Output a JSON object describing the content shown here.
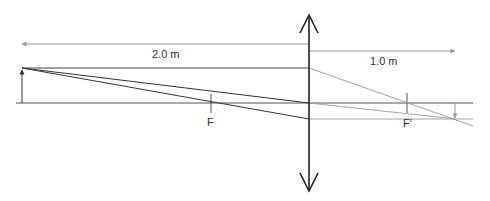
{
  "diagram": {
    "labels": {
      "object_distance": "2.0 m",
      "image_distance": "1.0 m",
      "focal_point_left": "F",
      "focal_point_right": "F′"
    },
    "colors": {
      "axis": "#555555",
      "lens": "#222222",
      "ray_dark": "#333333",
      "ray_light": "#999999",
      "dimension": "#999999",
      "text": "#333333"
    },
    "elements": [
      "optical-axis",
      "converging-lens",
      "object-arrow",
      "image-arrow",
      "focal-point-F",
      "focal-point-F-prime",
      "distance-2.0m-arrow",
      "distance-1.0m-arrow",
      "parallel-ray",
      "center-ray",
      "focal-ray"
    ]
  }
}
